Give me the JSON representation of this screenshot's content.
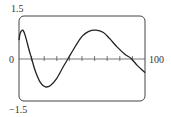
{
  "chart_data": {
    "type": "line",
    "title": "",
    "xlabel": "",
    "ylabel": "",
    "xlim": [
      0,
      100
    ],
    "ylim": [
      -1.5,
      1.5
    ],
    "grid": false,
    "legend": null,
    "tick_labels": {
      "y_top": "1.5",
      "y_bottom": "−1.5",
      "x_origin": "0",
      "x_end": "100"
    },
    "x_ticks": [
      10,
      20,
      30,
      40,
      50,
      60,
      70,
      80,
      90
    ],
    "series": [
      {
        "name": "f(x)",
        "x": [
          0,
          1,
          3,
          5,
          8,
          10,
          13,
          17,
          21,
          25,
          30,
          35,
          39,
          45,
          50,
          55,
          61,
          67,
          72,
          78,
          84,
          89,
          94,
          100
        ],
        "values": [
          0.65,
          0.9,
          1.0,
          0.8,
          0.3,
          0.0,
          -0.45,
          -0.85,
          -1.0,
          -0.95,
          -0.7,
          -0.3,
          0.0,
          0.45,
          0.78,
          0.95,
          1.0,
          0.92,
          0.7,
          0.4,
          0.15,
          0.0,
          -0.25,
          -0.5
        ]
      }
    ]
  }
}
